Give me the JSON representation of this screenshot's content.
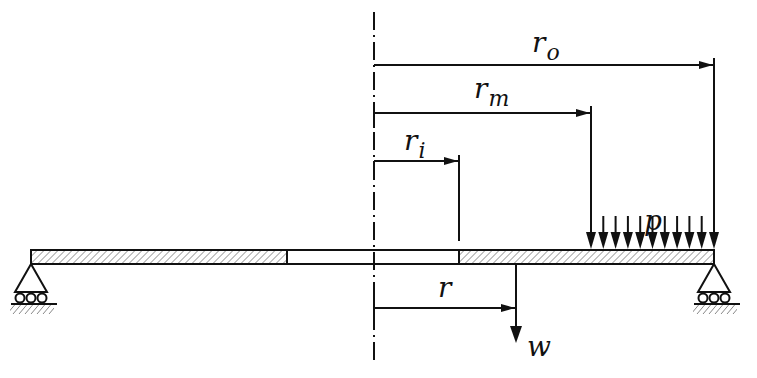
{
  "diagram": {
    "labels": {
      "r_outer": {
        "base": "r",
        "sub": "o"
      },
      "r_mid": {
        "base": "r",
        "sub": "m"
      },
      "r_inner": {
        "base": "r",
        "sub": "i"
      },
      "r_general": "r",
      "pressure": "p",
      "deflection": "w"
    },
    "geometry": {
      "axis_x": 374,
      "plate_left": 31,
      "plate_right": 714,
      "plate_top": 250,
      "plate_bottom": 264,
      "hole_left": 287,
      "hole_right": 459,
      "r_mid_x": 591,
      "r_general_x": 516,
      "load_arrow_count": 11
    },
    "colors": {
      "line": "#111111",
      "background": "#ffffff"
    }
  }
}
